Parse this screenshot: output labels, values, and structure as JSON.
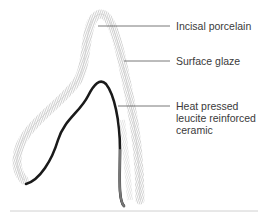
{
  "diagram": {
    "labels": {
      "incisal": "Incisal porcelain",
      "glaze": "Surface glaze",
      "core": {
        "line1": "Heat pressed",
        "line2": "leucite reinforced",
        "line3": "ceramic"
      }
    },
    "colors": {
      "background": "#ffffff",
      "outer_layer": "#b8b8b8",
      "core_layer": "#1a1a1a",
      "leader_line": "#555555",
      "text": "#3a3a3a",
      "baseline": "#d0d0d0"
    }
  }
}
